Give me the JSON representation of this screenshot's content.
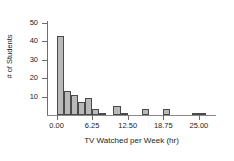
{
  "chart_data": {
    "type": "bar",
    "title": "",
    "subtitle": "",
    "xlabel": "TV Watched per Week (hr)",
    "ylabel": "# of Students",
    "xlim": [
      -1.5,
      28.0
    ],
    "ylim": [
      0,
      50
    ],
    "grid": false,
    "legend": null,
    "bin_width": 1.25,
    "xticks": [
      0.0,
      6.25,
      12.5,
      18.75,
      25.0
    ],
    "xtick_labels": [
      "0.00",
      "6.25",
      "12.50",
      "18.75",
      "25.00"
    ],
    "yticks": [
      10,
      20,
      30,
      40,
      50
    ],
    "ytick_labels": [
      "10",
      "20",
      "30",
      "40",
      "50"
    ],
    "categories": [
      "0.00",
      "1.25",
      "2.50",
      "3.75",
      "5.00",
      "6.25",
      "7.50",
      "10.00",
      "11.25",
      "15.00",
      "18.75",
      "23.75",
      "25.00"
    ],
    "bin_starts": [
      0.0,
      1.25,
      2.5,
      3.75,
      5.0,
      6.25,
      7.5,
      10.0,
      11.25,
      15.0,
      18.75,
      23.75,
      25.0
    ],
    "values": [
      43,
      13,
      11,
      7,
      9,
      3,
      1,
      5,
      1,
      3,
      3,
      1,
      1
    ],
    "bar_color": "#b9b9b9",
    "bar_edge_color": "#4a4a4a",
    "axis_color": "#6d6d6d"
  }
}
